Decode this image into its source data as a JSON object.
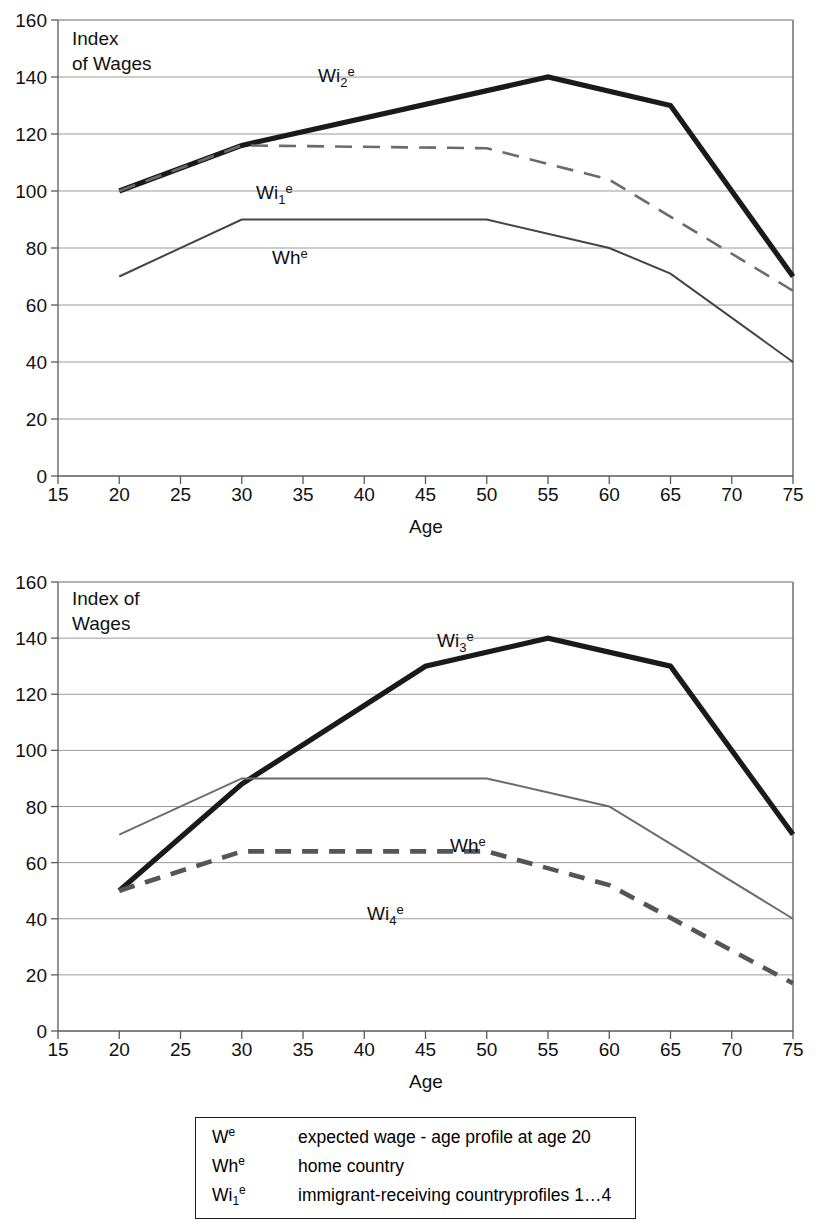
{
  "charts": [
    {
      "id": "chart-top",
      "note_line1": "Index",
      "note_line2": "of Wages",
      "xlabel": "Age",
      "x_ticks": [
        "15",
        "20",
        "25",
        "30",
        "35",
        "40",
        "45",
        "50",
        "55",
        "60",
        "65",
        "70",
        "75"
      ],
      "y_ticks": [
        "0",
        "20",
        "40",
        "60",
        "80",
        "100",
        "120",
        "140",
        "160"
      ],
      "series_labels": [
        {
          "name": "Wi2e",
          "base": "Wi",
          "sub": "2",
          "sup": "e"
        },
        {
          "name": "Wi1e",
          "base": "Wi",
          "sub": "1",
          "sup": "e"
        },
        {
          "name": "Whe",
          "base": "Wh",
          "sub": "",
          "sup": "e"
        }
      ]
    },
    {
      "id": "chart-bottom",
      "note_line1": "Index of",
      "note_line2": "Wages",
      "xlabel": "Age",
      "x_ticks": [
        "15",
        "20",
        "25",
        "30",
        "35",
        "40",
        "45",
        "50",
        "55",
        "60",
        "65",
        "70",
        "75"
      ],
      "y_ticks": [
        "0",
        "20",
        "40",
        "60",
        "80",
        "100",
        "120",
        "140",
        "160"
      ],
      "series_labels": [
        {
          "name": "Wi3e",
          "base": "Wi",
          "sub": "3",
          "sup": "e"
        },
        {
          "name": "Whe",
          "base": "Wh",
          "sub": "",
          "sup": "e"
        },
        {
          "name": "Wi4e",
          "base": "Wi",
          "sub": "4",
          "sup": "e"
        }
      ]
    }
  ],
  "legend": {
    "rows": [
      {
        "symbol_base": "W",
        "symbol_sub": "",
        "symbol_sup": "e",
        "description": "expected wage - age profile at age 20"
      },
      {
        "symbol_base": "Wh",
        "symbol_sub": "",
        "symbol_sup": "e",
        "description": "home country"
      },
      {
        "symbol_base": "Wi",
        "symbol_sub": "1",
        "symbol_sup": "e",
        "description": "immigrant-receiving countryprofiles 1…4"
      }
    ]
  },
  "colors": {
    "thick_black": "#1a1a1a",
    "mid_gray": "#555555",
    "light_gray_line": "#6b6b6b",
    "grid": "#9a9a9a",
    "axis": "#5a5a5a",
    "text": "#111111"
  },
  "chart_data": [
    {
      "type": "line",
      "title": "",
      "subtitle": "Index of Wages",
      "xlabel": "Age",
      "ylabel": "Index of Wages",
      "xlim": [
        15,
        75
      ],
      "ylim": [
        0,
        160
      ],
      "xticks": [
        15,
        20,
        25,
        30,
        35,
        40,
        45,
        50,
        55,
        60,
        65,
        70,
        75
      ],
      "yticks": [
        0,
        20,
        40,
        60,
        80,
        100,
        120,
        140,
        160
      ],
      "grid": true,
      "legend_position": "inline-annotations",
      "series": [
        {
          "name": "Wi2e",
          "label": "Wi₂ᵉ",
          "style": "solid-thick",
          "color": "#1a1a1a",
          "x": [
            20,
            30,
            55,
            65,
            75
          ],
          "values": [
            100,
            116,
            140,
            130,
            70
          ]
        },
        {
          "name": "Wi1e",
          "label": "Wi₁ᵉ",
          "style": "dashed",
          "color": "#6b6b6b",
          "x": [
            20,
            30,
            50,
            60,
            75
          ],
          "values": [
            100,
            116,
            115,
            104,
            65
          ]
        },
        {
          "name": "Whe",
          "label": "Whᵉ",
          "style": "solid-thin",
          "color": "#444444",
          "x": [
            20,
            30,
            50,
            60,
            65,
            75
          ],
          "values": [
            70,
            90,
            90,
            80,
            71,
            40
          ]
        }
      ]
    },
    {
      "type": "line",
      "title": "",
      "subtitle": "Index of Wages",
      "xlabel": "Age",
      "ylabel": "Index of Wages",
      "xlim": [
        15,
        75
      ],
      "ylim": [
        0,
        160
      ],
      "xticks": [
        15,
        20,
        25,
        30,
        35,
        40,
        45,
        50,
        55,
        60,
        65,
        70,
        75
      ],
      "yticks": [
        0,
        20,
        40,
        60,
        80,
        100,
        120,
        140,
        160
      ],
      "grid": true,
      "legend_position": "inline-annotations",
      "series": [
        {
          "name": "Wi3e",
          "label": "Wi₃ᵉ",
          "style": "solid-thick",
          "color": "#1a1a1a",
          "x": [
            20,
            30,
            45,
            55,
            65,
            75
          ],
          "values": [
            50,
            88,
            130,
            140,
            130,
            70
          ]
        },
        {
          "name": "Whe",
          "label": "Whᵉ",
          "style": "solid-thin",
          "color": "#6b6b6b",
          "x": [
            20,
            30,
            50,
            60,
            75
          ],
          "values": [
            70,
            90,
            90,
            80,
            40
          ]
        },
        {
          "name": "Wi4e",
          "label": "Wi₄ᵉ",
          "style": "dashed-thick",
          "color": "#555555",
          "x": [
            20,
            30,
            50,
            60,
            75
          ],
          "values": [
            50,
            64,
            64,
            52,
            17
          ]
        }
      ]
    }
  ]
}
